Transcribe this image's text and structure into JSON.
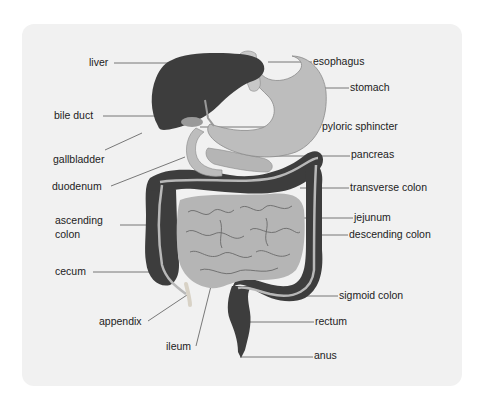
{
  "diagram": {
    "caption_partial": "",
    "colors": {
      "card_background": "#f1f1f1",
      "dark_organ": "#3d3d3d",
      "light_organ": "#b5b5b5",
      "mid_organ": "#9a9a9a",
      "leader_line": "#6a6a6a",
      "label_text": "#222222"
    },
    "labels": {
      "liver": "liver",
      "bile_duct": "bile duct",
      "gallbladder": "gallbladder",
      "duodenum": "duodenum",
      "ascending_colon_1": "ascending",
      "ascending_colon_2": "colon",
      "cecum": "cecum",
      "appendix": "appendix",
      "ileum": "ileum",
      "esophagus": "esophagus",
      "stomach": "stomach",
      "pyloric_sphincter": "pyloric sphincter",
      "pancreas": "pancreas",
      "transverse_colon": "transverse colon",
      "jejunum": "jejunum",
      "descending_colon": "descending colon",
      "sigmoid_colon": "sigmoid colon",
      "rectum": "rectum",
      "anus": "anus"
    }
  }
}
